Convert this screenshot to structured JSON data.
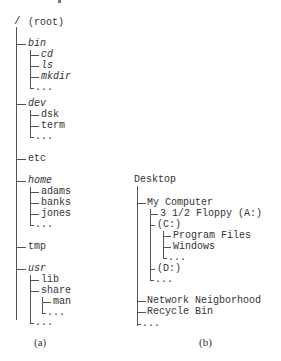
{
  "figure_a": {
    "caption": "(a)",
    "root": {
      "slash": "/",
      "label": "(root)"
    },
    "nodes": [
      {
        "label": "bin",
        "italic": true,
        "children": [
          "cd",
          "ls",
          "mkdir",
          "..."
        ],
        "children_italic": true
      },
      {
        "label": "dev",
        "italic": true,
        "children": [
          "dsk",
          "term",
          "..."
        ]
      },
      {
        "label": "etc",
        "italic": false,
        "children": []
      },
      {
        "label": "home",
        "italic": true,
        "children": [
          "adams",
          "banks",
          "jones",
          "..."
        ]
      },
      {
        "label": "tmp",
        "italic": false,
        "children": []
      },
      {
        "label": "usr",
        "italic": true,
        "children": [
          "lib",
          "share",
          "..."
        ],
        "share_children": [
          "man",
          "..."
        ]
      }
    ]
  },
  "figure_b": {
    "caption": "(b)",
    "root": "Desktop",
    "my_computer": {
      "label": "My Computer",
      "children": [
        "3 1/2 Floppy (A:)",
        "(C:)",
        "(D:)",
        "..."
      ],
      "c_children": [
        "Program Files",
        "Windows",
        "..."
      ]
    },
    "others": [
      "Network Neigborhood",
      "Recycle Bin",
      "..."
    ]
  }
}
